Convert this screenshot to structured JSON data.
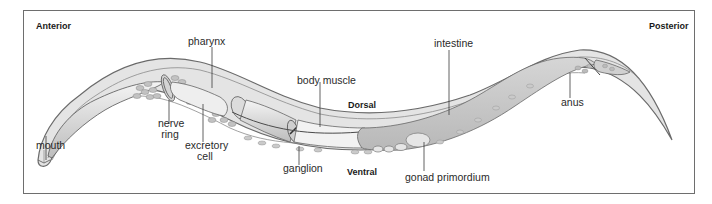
{
  "orientation": {
    "anterior": "Anterior",
    "posterior": "Posterior",
    "dorsal": "Dorsal",
    "ventral": "Ventral"
  },
  "labels": {
    "mouth": "mouth",
    "nerve_ring_1": "nerve",
    "nerve_ring_2": "ring",
    "pharynx": "pharynx",
    "excretory_cell_1": "excretory",
    "excretory_cell_2": "cell",
    "body_muscle": "body muscle",
    "ganglion": "ganglion",
    "intestine": "intestine",
    "gonad_primordium": "gonad primordium",
    "anus": "anus"
  },
  "colors": {
    "frame": "#6e6e6e",
    "body_fill": "#e2e2e2",
    "cuticle": "#6a6a6a",
    "organ_fill": "#c9c9c9",
    "light_organ": "#f0f0f0",
    "cell_fill": "#b5b5b5",
    "leader_line": "#3a3a3a"
  }
}
